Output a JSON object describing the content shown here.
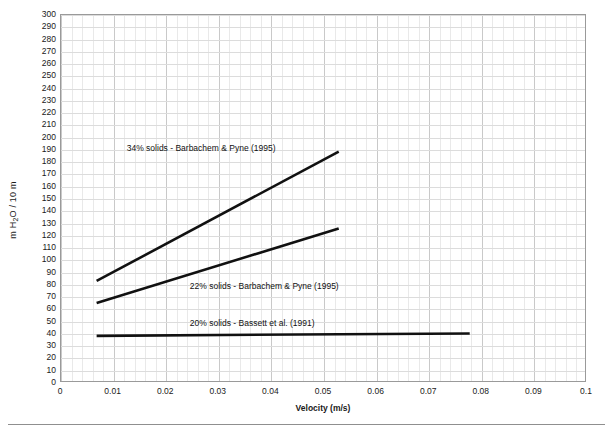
{
  "chart_data": {
    "type": "line",
    "title": "",
    "xlabel": "Velocity (m/s)",
    "ylabel": "m H2O / 10 m",
    "ylabel_parts": {
      "pre": "m H",
      "sub": "2",
      "post": "O / 10 m"
    },
    "xlim": [
      0,
      0.1
    ],
    "ylim": [
      0,
      300
    ],
    "xticks": [
      0,
      0.01,
      0.02,
      0.03,
      0.04,
      0.05,
      0.06,
      0.07,
      0.08,
      0.09,
      0.1
    ],
    "xtick_labels": [
      "0",
      "0.01",
      "0.02",
      "0.03",
      "0.04",
      "0.05",
      "0.06",
      "0.07",
      "0.08",
      "0.09",
      "0.1"
    ],
    "yticks": [
      0,
      10,
      20,
      30,
      40,
      50,
      60,
      70,
      80,
      90,
      100,
      110,
      120,
      130,
      140,
      150,
      160,
      170,
      180,
      190,
      200,
      210,
      220,
      230,
      240,
      250,
      260,
      270,
      280,
      290,
      300
    ],
    "ytick_labels": [
      "0",
      "10",
      "20",
      "30",
      "40",
      "50",
      "60",
      "70",
      "80",
      "90",
      "100",
      "110",
      "120",
      "130",
      "140",
      "150",
      "160",
      "170",
      "180",
      "190",
      "200",
      "210",
      "220",
      "230",
      "240",
      "250",
      "260",
      "270",
      "280",
      "290",
      "300"
    ],
    "grid": true,
    "grid_minor": true,
    "legend": "inline-annotations",
    "line_color": "#111111",
    "series": [
      {
        "name": "34% solids - Barbachem & Pyne (1995)",
        "label": "34% solids - Barbachem & Pyne (1995)",
        "x": [
          0.0068,
          0.053
        ],
        "y": [
          82,
          188
        ],
        "annotation_x": 0.0125,
        "annotation_y": 196
      },
      {
        "name": "22% solids - Barbachem & Pyne (1995)",
        "label": "22% solids - Barbachem & Pyne (1995)",
        "x": [
          0.0068,
          0.053
        ],
        "y": [
          64,
          125
        ],
        "annotation_x": 0.0245,
        "annotation_y": 83
      },
      {
        "name": "20% solids - Bassett et al. (1991)",
        "label": "20% solids - Bassett et al. (1991)",
        "x": [
          0.0068,
          0.078
        ],
        "y": [
          37,
          39
        ],
        "annotation_x": 0.0245,
        "annotation_y": 53
      }
    ]
  },
  "caption": {
    "rule": true,
    "text": ""
  }
}
